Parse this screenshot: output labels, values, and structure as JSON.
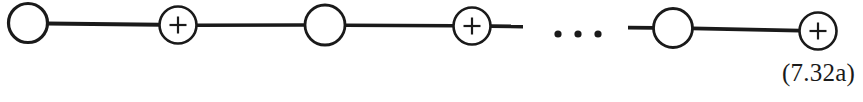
{
  "figure": {
    "type": "diagram",
    "width": 863,
    "height": 102,
    "background_color": "#ffffff",
    "stroke_color": "#1a1a1a",
    "equation_label": "(7.32a)",
    "ellipsis_text": "• • •",
    "nodes": [
      {
        "id": "node-1",
        "symbol": "",
        "cx": 28,
        "cy": 23,
        "r": 19.5,
        "stroke_width": 3.2
      },
      {
        "id": "node-2",
        "symbol": "+",
        "cx": 178,
        "cy": 25,
        "r": 18.5,
        "stroke_width": 2.6
      },
      {
        "id": "node-3",
        "symbol": "",
        "cx": 325,
        "cy": 25,
        "r": 20.0,
        "stroke_width": 2.8
      },
      {
        "id": "node-4",
        "symbol": "+",
        "cx": 472,
        "cy": 26,
        "r": 18.5,
        "stroke_width": 2.6
      },
      {
        "id": "node-5",
        "symbol": "",
        "cx": 673,
        "cy": 28,
        "r": 19.5,
        "stroke_width": 2.8
      },
      {
        "id": "node-6",
        "symbol": "+",
        "cx": 818,
        "cy": 31,
        "r": 18.5,
        "stroke_width": 2.6
      }
    ],
    "edges": [
      {
        "id": "edge-1",
        "x1": 47,
        "y1": 23.6,
        "x2": 160,
        "y2": 24.8,
        "stroke_width": 4.0
      },
      {
        "id": "edge-2",
        "x1": 196,
        "y1": 25.2,
        "x2": 306,
        "y2": 25.0,
        "stroke_width": 3.6
      },
      {
        "id": "edge-3",
        "x1": 345,
        "y1": 25.2,
        "x2": 454,
        "y2": 25.8,
        "stroke_width": 3.6
      },
      {
        "id": "edge-4",
        "x1": 491,
        "y1": 26.2,
        "x2": 523,
        "y2": 26.5,
        "stroke_width": 3.8
      },
      {
        "id": "edge-5",
        "x1": 628,
        "y1": 27.6,
        "x2": 654,
        "y2": 27.8,
        "stroke_width": 3.8
      },
      {
        "id": "edge-6",
        "x1": 692,
        "y1": 28.4,
        "x2": 800,
        "y2": 30.6,
        "stroke_width": 3.6
      }
    ],
    "ellipsis_dots": [
      {
        "id": "dot-1",
        "cx": 558,
        "cy": 34,
        "r": 3.6
      },
      {
        "id": "dot-2",
        "cx": 578,
        "cy": 34,
        "r": 3.6
      },
      {
        "id": "dot-3",
        "cx": 598,
        "cy": 34,
        "r": 3.6
      }
    ],
    "plus_glyph": {
      "arm": 8.5,
      "stroke_width": 2.2
    }
  }
}
